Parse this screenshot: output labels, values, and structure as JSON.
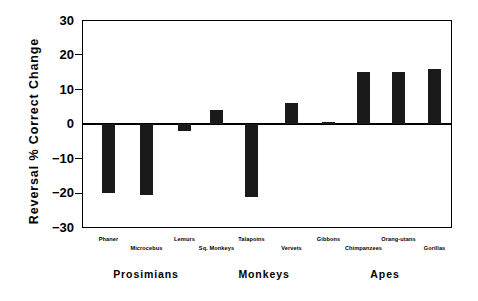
{
  "chart_data": {
    "type": "bar",
    "title": "",
    "xlabel": "",
    "ylabel": "Reversal  %  Correct  Change",
    "ylim": [
      -30,
      30
    ],
    "yticks": [
      30,
      20,
      10,
      0,
      -10,
      -20,
      -30
    ],
    "ytick_labels": [
      "30",
      "20",
      "10",
      "0",
      "−10",
      "−20",
      "−30"
    ],
    "grid": false,
    "legend": "none",
    "zero_line": true,
    "bar_color": "#1a1a1a",
    "categories": [
      "Phaner",
      "Microcebus",
      "Lemurs",
      "Sq. Monkeys",
      "Talapoins",
      "Vervets",
      "Gibbons",
      "Chimpanzees",
      "Orang-utans",
      "Gorillas"
    ],
    "values": [
      -20,
      -20.5,
      -2,
      4,
      -21,
      6,
      0.5,
      15,
      15,
      16
    ],
    "groups": [
      {
        "label": "Prosimians",
        "members": [
          "Phaner",
          "Microcebus",
          "Lemurs"
        ]
      },
      {
        "label": "Monkeys",
        "members": [
          "Sq. Monkeys",
          "Talapoins",
          "Vervets"
        ]
      },
      {
        "label": "Apes",
        "members": [
          "Gibbons",
          "Chimpanzees",
          "Orang-utans",
          "Gorillas"
        ]
      }
    ]
  }
}
